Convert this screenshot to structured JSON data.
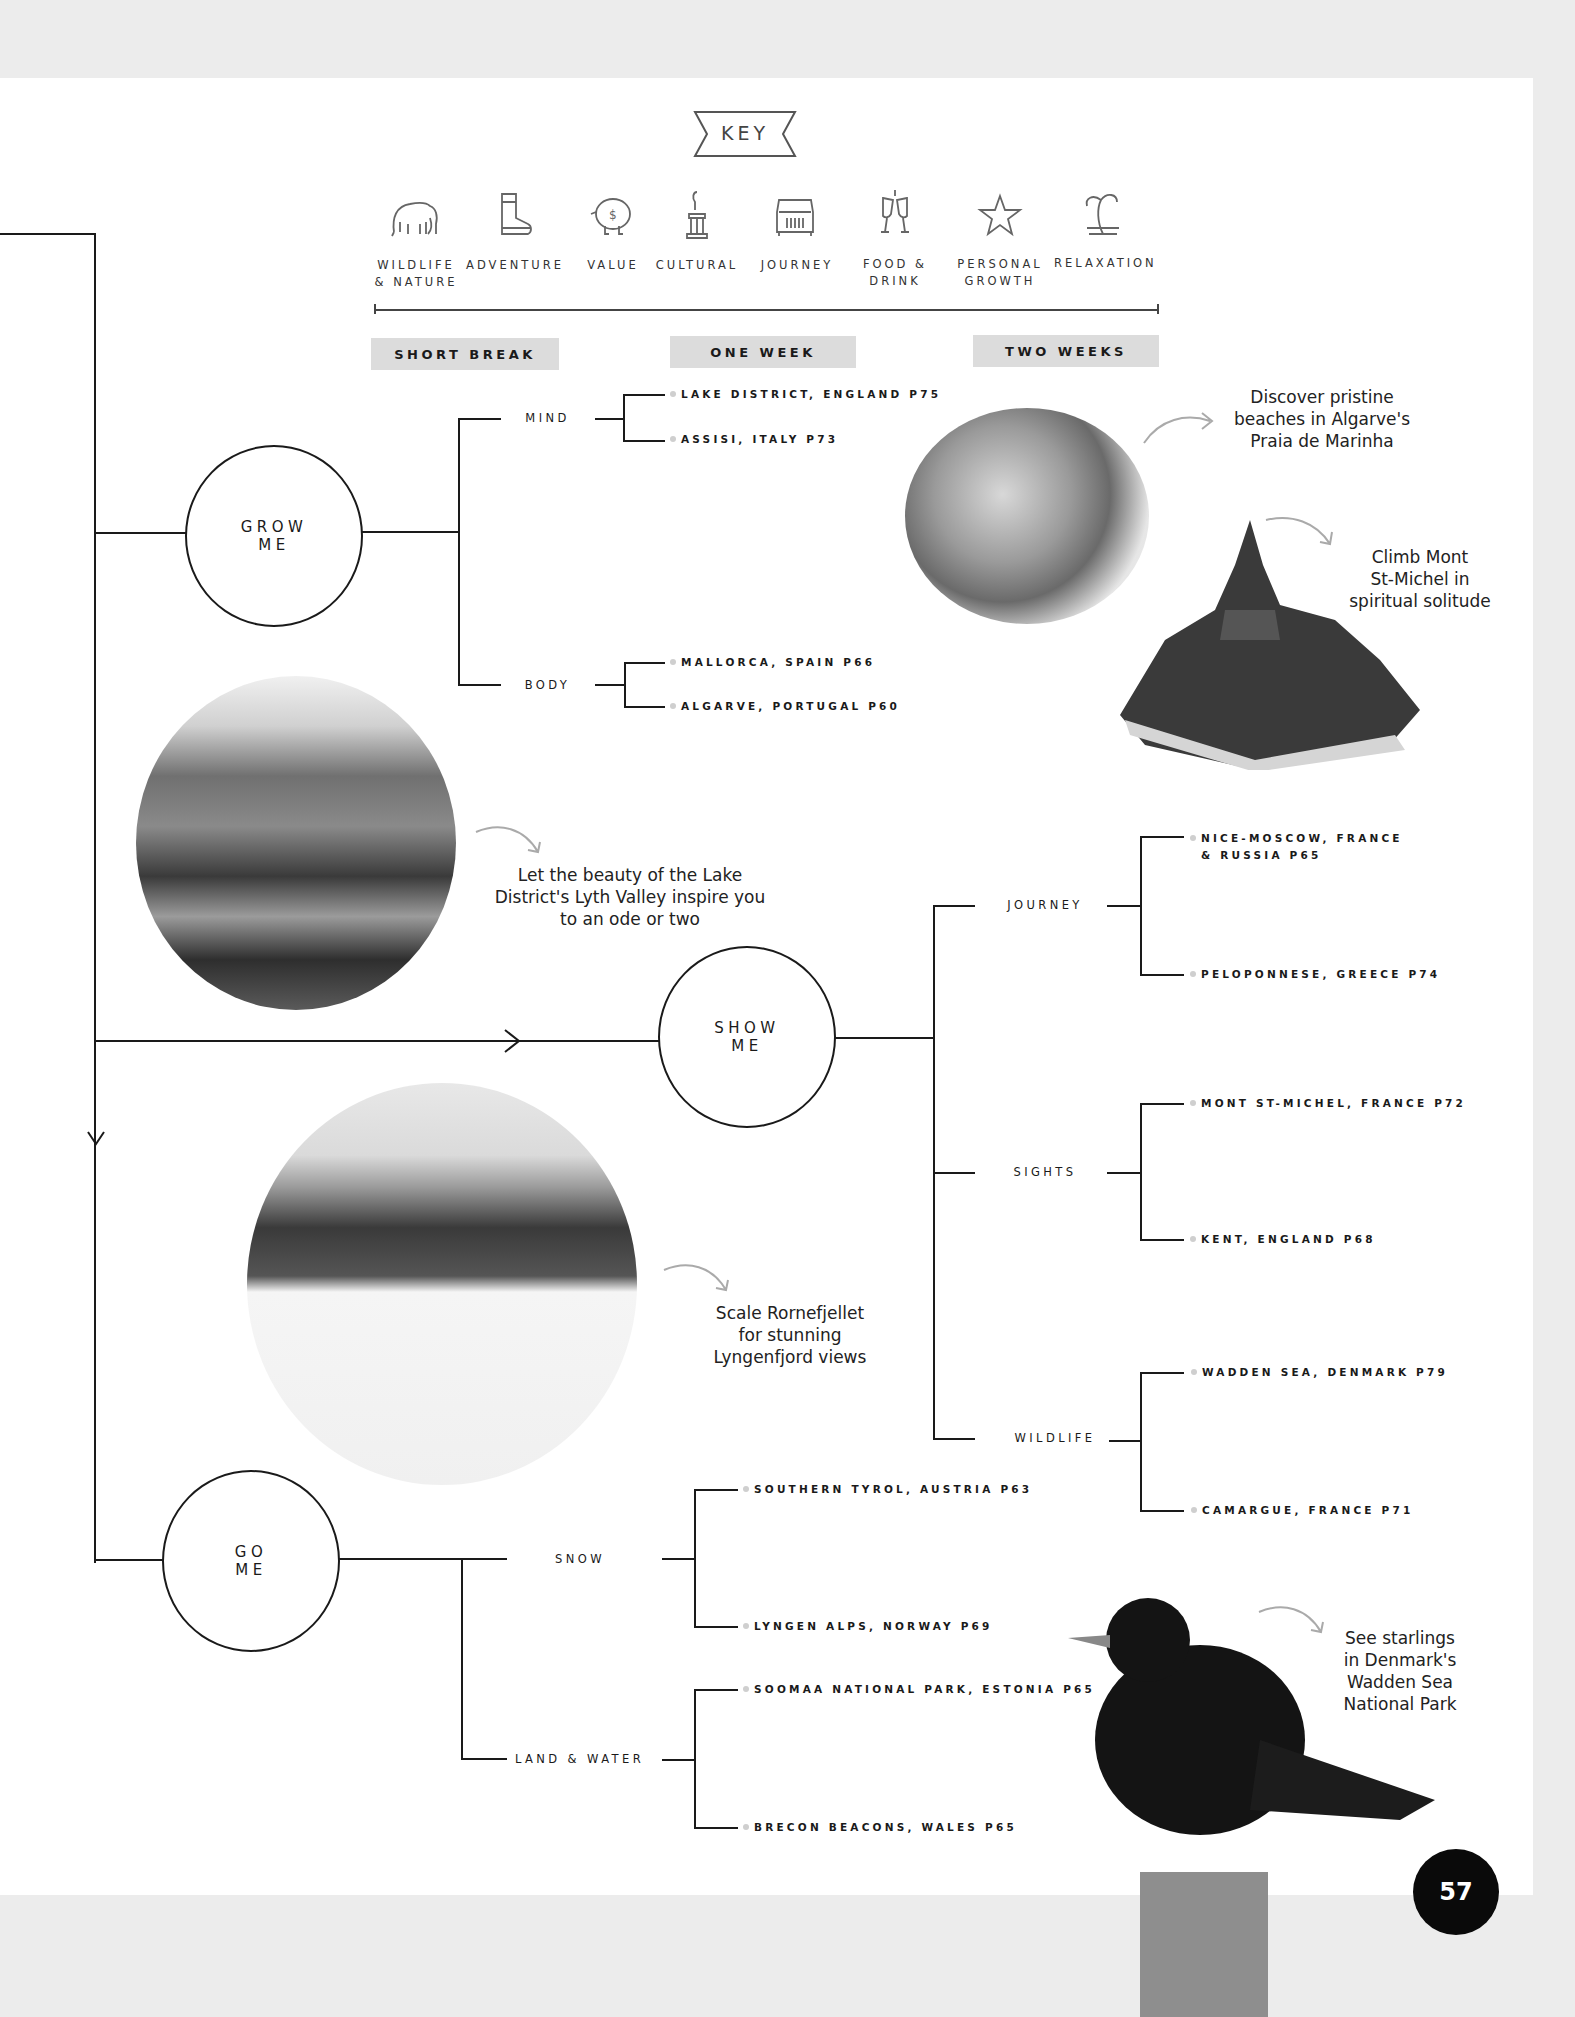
{
  "key": {
    "title": "KEY",
    "icons": [
      {
        "icon": "elephant-icon",
        "label_lines": [
          "WILDLIFE",
          "& NATURE"
        ]
      },
      {
        "icon": "boot-icon",
        "label_lines": [
          "ADVENTURE"
        ]
      },
      {
        "icon": "piggy-bank-icon",
        "label_lines": [
          "VALUE"
        ]
      },
      {
        "icon": "statue-icon",
        "label_lines": [
          "CULTURAL"
        ]
      },
      {
        "icon": "jeep-icon",
        "label_lines": [
          "JOURNEY"
        ]
      },
      {
        "icon": "wine-glasses-icon",
        "label_lines": [
          "FOOD &",
          "DRINK"
        ]
      },
      {
        "icon": "star-icon",
        "label_lines": [
          "PERSONAL",
          "GROWTH"
        ]
      },
      {
        "icon": "palm-tree-icon",
        "label_lines": [
          "RELAXATION"
        ]
      }
    ]
  },
  "durations": [
    "SHORT BREAK",
    "ONE WEEK",
    "TWO WEEKS"
  ],
  "tree": {
    "grow": {
      "label_lines": [
        "GROW",
        "ME"
      ],
      "branches": [
        {
          "label": "MIND",
          "leaves": [
            "LAKE DISTRICT, ENGLAND P75",
            "ASSISI, ITALY P73"
          ]
        },
        {
          "label": "BODY",
          "leaves": [
            "MALLORCA, SPAIN P66",
            "ALGARVE, PORTUGAL P60"
          ]
        }
      ]
    },
    "show": {
      "label_lines": [
        "SHOW",
        "ME"
      ],
      "branches": [
        {
          "label": "JOURNEY",
          "leaves": [
            [
              "NICE-MOSCOW, FRANCE",
              "& RUSSIA P65"
            ],
            [
              "PELOPONNESE, GREECE P74"
            ]
          ]
        },
        {
          "label": "SIGHTS",
          "leaves": [
            [
              "MONT ST-MICHEL, FRANCE P72"
            ],
            [
              "KENT, ENGLAND P68"
            ]
          ]
        },
        {
          "label": "WILDLIFE",
          "leaves": [
            [
              "WADDEN SEA, DENMARK P79"
            ],
            [
              "CAMARGUE, FRANCE P71"
            ]
          ]
        }
      ]
    },
    "go": {
      "label_lines": [
        "GO",
        "ME"
      ],
      "branches": [
        {
          "label": "SNOW",
          "leaves": [
            "SOUTHERN TYROL, AUSTRIA P63",
            "LYNGEN ALPS, NORWAY P69"
          ]
        },
        {
          "label": "LAND & WATER",
          "leaves": [
            "SOOMAA NATIONAL PARK, ESTONIA P65",
            "BRECON BEACONS, WALES P65"
          ]
        }
      ]
    }
  },
  "notes": {
    "algarve": [
      "Discover pristine",
      "beaches in Algarve's",
      "Praia de Marinha"
    ],
    "mont": [
      "Climb Mont",
      "St-Michel in",
      "spiritual solitude"
    ],
    "lake": [
      "Let the beauty of the Lake",
      "District's Lyth Valley inspire you",
      "to an ode or two"
    ],
    "lyngen": [
      "Scale Rornefjellet",
      "for stunning",
      "Lyngenfjord views"
    ],
    "starling": [
      "See starlings",
      "in Denmark's",
      "Wadden Sea",
      "National Park"
    ]
  },
  "page_number": "57"
}
